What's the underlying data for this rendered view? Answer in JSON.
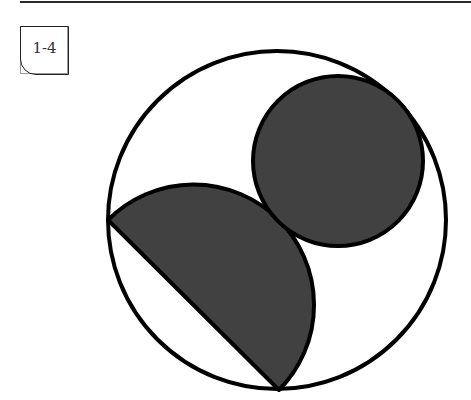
{
  "badge": {
    "label": "1-4"
  },
  "figure": {
    "colors": {
      "stroke": "#000000",
      "fill": "#414141",
      "background": "#ffffff"
    },
    "outer_circle": {
      "cx": 277,
      "cy": 220,
      "r": 170
    },
    "small_circle": {
      "cx": 338,
      "cy": 161,
      "r": 86
    },
    "semicircle": {
      "chord_start": [
        108,
        220
      ],
      "chord_end": [
        279,
        390
      ],
      "r": 120.5
    }
  }
}
